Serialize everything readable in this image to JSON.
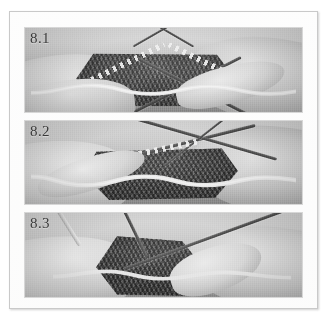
{
  "figure": {
    "kind": "instructional-photo-series",
    "medium": "grayscale-scan",
    "panel_count": 3,
    "frame_color": "#c9c9c9",
    "page_background": "#ffffff",
    "panels": [
      {
        "label": "8.1",
        "caption": "",
        "description": "Both hands hold two knitting needles crossed in an inverted V over dark stockinette fabric; pale yarn strand runs across the lower edge."
      },
      {
        "label": "8.2",
        "caption": "",
        "description": "Needles angled to the right as the right hand wraps the working yarn; stitches visible as light marks along the left needle."
      },
      {
        "label": "8.3",
        "caption": "",
        "description": "A single needle tip is drawn through the stitch, the fabric bunched between the fingers of the left hand."
      }
    ],
    "label_color": "#2a2a2a",
    "fabric_color": "#45423e",
    "needle_color": "#4a4744",
    "yarn_color": "#efebe4"
  }
}
